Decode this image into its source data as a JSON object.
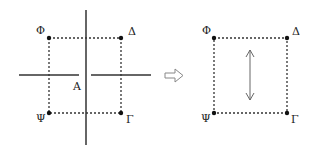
{
  "left_diagram": {
    "corners": {
      "top_left": "Φ",
      "top_right": "Δ",
      "bottom_left": "Ψ",
      "bottom_right": "Γ"
    },
    "center_label": "A"
  },
  "right_diagram": {
    "corners": {
      "top_left": "Φ",
      "top_right": "Δ",
      "bottom_left": "Ψ",
      "bottom_right": "Γ"
    }
  },
  "colors": {
    "line": "#333333",
    "dots": "#111111",
    "arrow": "#666666"
  }
}
